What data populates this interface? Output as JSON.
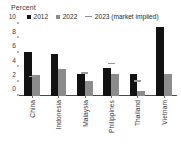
{
  "chart_data": {
    "type": "bar",
    "title": "",
    "ylabel": "Percent",
    "xlabel": "",
    "ylim": [
      0,
      10
    ],
    "yticks": [
      0,
      2,
      4,
      6,
      8,
      10
    ],
    "grid": false,
    "legend_position": "top",
    "categories": [
      "China",
      "Indonesia",
      "Malaysia",
      "Philippines",
      "Thailand",
      "Vietnam"
    ],
    "series": [
      {
        "name": "2012",
        "type": "bar",
        "color": "#121212",
        "values": [
          6.1,
          5.8,
          3.0,
          3.9,
          3.0,
          9.6
        ]
      },
      {
        "name": "2022",
        "type": "bar",
        "color": "#8c8c8c",
        "values": [
          2.9,
          3.8,
          2.1,
          3.1,
          0.7,
          3.0
        ]
      },
      {
        "name": "2023 (market implied)",
        "type": "marker",
        "color": "#9a9a9a",
        "values": [
          2.6,
          null,
          3.1,
          4.4,
          2.0,
          null
        ]
      }
    ]
  },
  "legend": {
    "items": [
      {
        "label": "2012",
        "marker": "square-black"
      },
      {
        "label": "2022",
        "marker": "square-gray"
      },
      {
        "label": "2023 (market implied)",
        "marker": "dash-gray"
      }
    ]
  },
  "axis": {
    "y_title": "Percent"
  }
}
